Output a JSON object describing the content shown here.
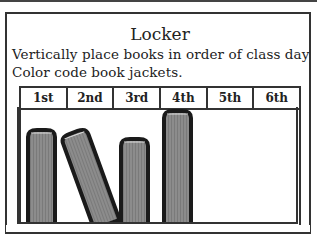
{
  "title": "Locker",
  "instructions": [
    "Vertically place books in order of class day",
    "Color code book jackets."
  ],
  "periods": [
    "1st",
    "2nd",
    "3rd",
    "4th",
    "5th",
    "6th"
  ],
  "colors": {
    "border": "#333333",
    "book_fill": "#8a8a8a",
    "book_outline": "#1a1a1a"
  },
  "books": [
    {
      "label": "book-1st",
      "x": 28,
      "top": 130,
      "height": 103,
      "angle": 0
    },
    {
      "label": "book-2nd",
      "x": 63,
      "top": 133,
      "height": 98,
      "angle": -20
    },
    {
      "label": "book-3rd",
      "x": 121,
      "top": 139,
      "height": 93,
      "angle": 0
    },
    {
      "label": "book-4th",
      "x": 163,
      "top": 111,
      "height": 121,
      "angle": 0
    }
  ]
}
